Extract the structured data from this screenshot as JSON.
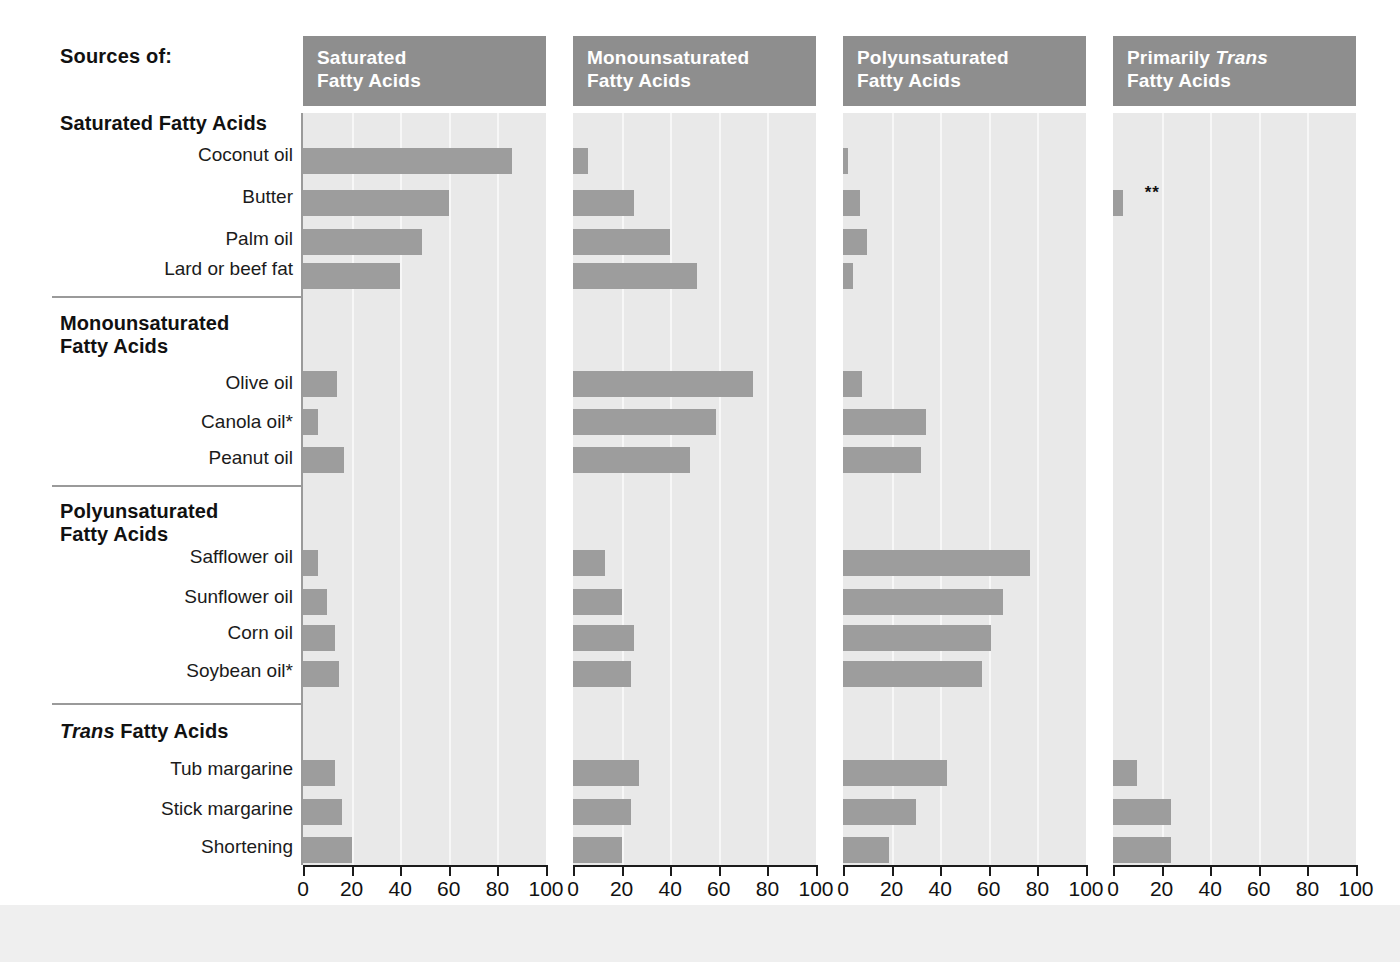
{
  "title": "Sources of:",
  "columns": [
    {
      "id": "sat",
      "label_line1": "Saturated",
      "label_line2": "Fatty Acids",
      "italic_word": ""
    },
    {
      "id": "mono",
      "label_line1": "Monounsaturated",
      "label_line2": "Fatty Acids",
      "italic_word": ""
    },
    {
      "id": "poly",
      "label_line1": "Polyunsaturated",
      "label_line2": "Fatty Acids",
      "italic_word": ""
    },
    {
      "id": "trans",
      "label_line1": "Primarily ",
      "label_line2": "Fatty Acids",
      "italic_word": "Trans"
    }
  ],
  "groups": [
    {
      "name": "Saturated Fatty Acids",
      "italic_lead": "",
      "rows": [
        "Coconut oil",
        "Butter",
        "Palm oil",
        "Lard or beef fat"
      ]
    },
    {
      "name": "Monounsaturated\nFatty Acids",
      "italic_lead": "",
      "rows": [
        "Olive oil",
        "Canola oil*",
        "Peanut oil"
      ]
    },
    {
      "name": "Polyunsaturated\nFatty Acids",
      "italic_lead": "",
      "rows": [
        "Safflower oil",
        "Sunflower oil",
        "Corn oil",
        "Soybean oil*"
      ]
    },
    {
      "name": " Fatty Acids",
      "italic_lead": "Trans",
      "rows": [
        "Tub margarine",
        "Stick margarine",
        "Shortening"
      ]
    }
  ],
  "annotations": [
    {
      "row": "Butter",
      "column": "trans",
      "text": "**"
    }
  ],
  "axis": {
    "ticks": [
      0,
      20,
      40,
      60,
      80,
      100
    ],
    "min": 0,
    "max": 100
  },
  "colors": {
    "panel_background": "#e9e9e9",
    "panel_header": "#8e8e8e",
    "bar": "#9d9d9d",
    "gridline": "#f7f7f7",
    "axis": "#1b1b1b",
    "text": "#111111",
    "header_text": "#ffffff"
  },
  "chart_data": {
    "type": "bar",
    "xlabel": "",
    "ylabel": "",
    "xlim": [
      0,
      100
    ],
    "grid": true,
    "legend_position": "none",
    "orientation": "horizontal",
    "panels": [
      "Saturated Fatty Acids",
      "Monounsaturated Fatty Acids",
      "Polyunsaturated Fatty Acids",
      "Primarily Trans Fatty Acids"
    ],
    "categories": [
      "Coconut oil",
      "Butter",
      "Palm oil",
      "Lard or beef fat",
      "Olive oil",
      "Canola oil*",
      "Peanut oil",
      "Safflower oil",
      "Sunflower oil",
      "Corn oil",
      "Soybean oil*",
      "Tub margarine",
      "Stick margarine",
      "Shortening"
    ],
    "series": [
      {
        "name": "Saturated Fatty Acids",
        "values": [
          86,
          60,
          49,
          40,
          14,
          6,
          17,
          6,
          10,
          13,
          15,
          13,
          16,
          20
        ]
      },
      {
        "name": "Monounsaturated Fatty Acids",
        "values": [
          6,
          25,
          40,
          51,
          74,
          59,
          48,
          13,
          20,
          25,
          24,
          27,
          24,
          20
        ]
      },
      {
        "name": "Polyunsaturated Fatty Acids",
        "values": [
          2,
          7,
          10,
          4,
          8,
          34,
          32,
          77,
          66,
          61,
          57,
          43,
          30,
          19
        ]
      },
      {
        "name": "Primarily Trans Fatty Acids",
        "values": [
          0,
          4,
          0,
          0,
          0,
          0,
          0,
          0,
          0,
          0,
          0,
          10,
          24,
          24
        ]
      }
    ],
    "tick_labels": [
      "0",
      "20",
      "40",
      "60",
      "80",
      "100"
    ],
    "annotations": [
      "** next to Butter in Primarily Trans Fatty Acids column",
      "* Canola oil and Soybean oil footnote markers"
    ]
  }
}
